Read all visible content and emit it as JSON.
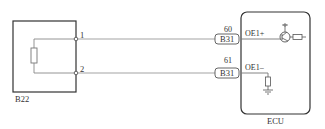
{
  "diagram": {
    "sensor": {
      "label": "B22",
      "pins": [
        {
          "number": "1"
        },
        {
          "number": "2"
        }
      ]
    },
    "ecu": {
      "label": "ECU",
      "connections": [
        {
          "pin": "60",
          "connector": "B31",
          "signal": "OE1+"
        },
        {
          "pin": "61",
          "connector": "B31",
          "signal": "OE1–"
        }
      ]
    },
    "colors": {
      "line": "#777777",
      "box": "#333333",
      "text": "#333333"
    }
  }
}
